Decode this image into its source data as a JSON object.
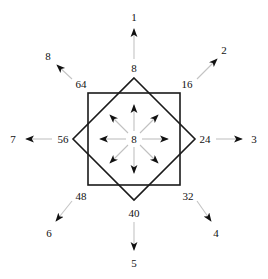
{
  "figure": {
    "name": "eight-direction-chain-code-diagram",
    "center_value": "8",
    "shapes": {
      "square_label": "square",
      "diamond_label": "diamond"
    },
    "colors": {
      "stroke": "#1a1a1a",
      "arrow_shaft": "#b5b5b5",
      "arrow_head": "#111111",
      "background": "#ffffff",
      "text": "#111111"
    },
    "geometry": {
      "center_x": 134,
      "center_y": 139,
      "square_half": 46,
      "diamond_radius": 61,
      "inner_arrow_length": 34,
      "outer_arrow_start": 72,
      "outer_arrow_end": 112
    }
  },
  "ring_labels": [
    {
      "id": "ring-top",
      "value": "8",
      "x": 134,
      "y": 68,
      "direction": "up"
    },
    {
      "id": "ring-top-right",
      "value": "16",
      "x": 187,
      "y": 84,
      "direction": "up-right"
    },
    {
      "id": "ring-right",
      "value": "24",
      "x": 205,
      "y": 139,
      "direction": "right"
    },
    {
      "id": "ring-bottom-right",
      "value": "32",
      "x": 188,
      "y": 196,
      "direction": "down-right"
    },
    {
      "id": "ring-bottom",
      "value": "40",
      "x": 134,
      "y": 213,
      "direction": "down"
    },
    {
      "id": "ring-bottom-left",
      "value": "48",
      "x": 81,
      "y": 196,
      "direction": "down-left"
    },
    {
      "id": "ring-left",
      "value": "56",
      "x": 63,
      "y": 139,
      "direction": "left"
    },
    {
      "id": "ring-top-left",
      "value": "64",
      "x": 81,
      "y": 84,
      "direction": "up-left"
    }
  ],
  "outer_labels": [
    {
      "id": "outer-1",
      "value": "1",
      "x": 134,
      "y": 17,
      "direction": "up"
    },
    {
      "id": "outer-2",
      "value": "2",
      "x": 224,
      "y": 50,
      "direction": "up-right"
    },
    {
      "id": "outer-3",
      "value": "3",
      "x": 254,
      "y": 139,
      "direction": "right"
    },
    {
      "id": "outer-4",
      "value": "4",
      "x": 216,
      "y": 233,
      "direction": "down-right"
    },
    {
      "id": "outer-5",
      "value": "5",
      "x": 134,
      "y": 263,
      "direction": "down"
    },
    {
      "id": "outer-6",
      "value": "6",
      "x": 49,
      "y": 233,
      "direction": "down-left"
    },
    {
      "id": "outer-7",
      "value": "7",
      "x": 13,
      "y": 139,
      "direction": "left"
    },
    {
      "id": "outer-8",
      "value": "8",
      "x": 48,
      "y": 56,
      "direction": "up-left"
    }
  ],
  "inner_arrows": [
    {
      "id": "inner-arrow-up",
      "direction": "up"
    },
    {
      "id": "inner-arrow-up-right",
      "direction": "up-right"
    },
    {
      "id": "inner-arrow-right",
      "direction": "right"
    },
    {
      "id": "inner-arrow-down-right",
      "direction": "down-right"
    },
    {
      "id": "inner-arrow-down",
      "direction": "down"
    },
    {
      "id": "inner-arrow-down-left",
      "direction": "down-left"
    },
    {
      "id": "inner-arrow-left",
      "direction": "left"
    },
    {
      "id": "inner-arrow-up-left",
      "direction": "up-left"
    }
  ]
}
